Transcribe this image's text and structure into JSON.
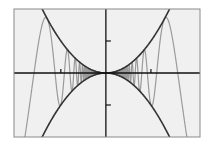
{
  "chart_data": {
    "type": "line",
    "title": "",
    "xlabel": "",
    "ylabel": "",
    "xlim": [
      -2.04,
      2.09
    ],
    "ylim": [
      -2,
      2
    ],
    "grid": false,
    "legend": "none",
    "x_ticks": [
      -1,
      1
    ],
    "y_ticks": [
      -1,
      1
    ],
    "tick_labels_shown": false,
    "series": [
      {
        "name": "upper-envelope",
        "formula": "x^2",
        "color": "#333333"
      },
      {
        "name": "lower-envelope",
        "formula": "-x^2",
        "color": "#333333"
      },
      {
        "name": "oscillating-curve",
        "formula": "-x^2 * sin(8 / x^2)",
        "color": "#9a9a9a"
      }
    ],
    "colors": {
      "background": "#ffffff",
      "plot_area": "#f0f0f0",
      "frame": "#8a8a8a",
      "axes": "#111111"
    }
  }
}
